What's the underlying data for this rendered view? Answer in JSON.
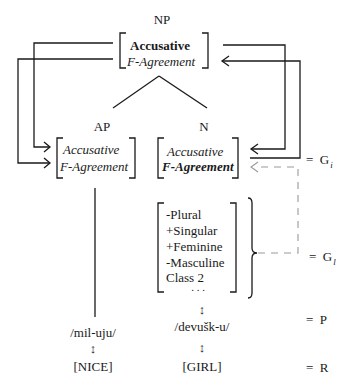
{
  "root": {
    "label": "NP",
    "features": {
      "case": "Accusative",
      "agreement": "F-Agreement"
    }
  },
  "ap": {
    "label": "AP",
    "features": {
      "case": "Accusative",
      "agreement": "F-Agreement"
    },
    "phonology": "/mil-uju/",
    "meaning": "[NICE]"
  },
  "n": {
    "label": "N",
    "features": {
      "case": "Accusative",
      "agreement": "F-Agreement"
    },
    "lexical_features": [
      "-Plural",
      "+Singular",
      "+Feminine",
      "-Masculine",
      "Class 2",
      ". . ."
    ],
    "phonology": "/devušk-u/",
    "meaning": "[GIRL]"
  },
  "link_symbol": "↕",
  "levels": [
    {
      "eq": "=",
      "symbol": "G",
      "subscript": "i"
    },
    {
      "eq": "=",
      "symbol": "G",
      "subscript": "l"
    },
    {
      "eq": "=",
      "symbol": "P",
      "subscript": ""
    },
    {
      "eq": "=",
      "symbol": "R",
      "subscript": ""
    }
  ],
  "colors": {
    "line": "#1a1a1a",
    "dashed": "#9a9a9a"
  }
}
